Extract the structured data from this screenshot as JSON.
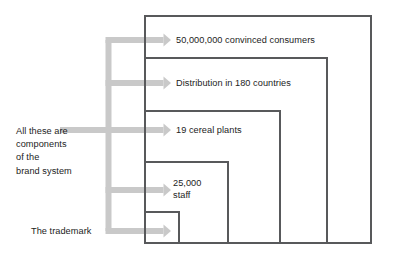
{
  "diagram": {
    "type": "nested-boxes-with-callouts",
    "colors": {
      "box_stroke": "#58595b",
      "arrow_fill": "#c9c9c9",
      "text": "#1c1c1c",
      "background": "#ffffff"
    },
    "side_label": {
      "name": "brand-system-note",
      "lines": [
        "All these are",
        "components",
        "of the",
        "brand system"
      ]
    },
    "trademark_label": {
      "name": "trademark-callout",
      "text": "The trademark"
    },
    "layers": [
      {
        "id": "consumers",
        "label": "50,000,000 convinced consumers",
        "level": 5,
        "box": {
          "x": 145,
          "y": 16,
          "width": 226,
          "height": 227
        }
      },
      {
        "id": "distribution",
        "label": "Distribution in 180 countries",
        "level": 4,
        "box": {
          "x": 145,
          "y": 58,
          "width": 182,
          "height": 185
        }
      },
      {
        "id": "plants",
        "label": "19 cereal plants",
        "level": 3,
        "box": {
          "x": 145,
          "y": 111,
          "width": 135,
          "height": 132
        }
      },
      {
        "id": "staff",
        "label": "25,000 staff",
        "label_lines": [
          "25,000",
          "staff"
        ],
        "level": 2,
        "box": {
          "x": 145,
          "y": 162,
          "width": 83,
          "height": 81
        }
      },
      {
        "id": "trademark",
        "label": "The trademark",
        "level": 1,
        "box": {
          "x": 145,
          "y": 212,
          "width": 34,
          "height": 31
        }
      }
    ],
    "arrows": [
      {
        "id": "arrow-consumers",
        "target": "consumers",
        "tip_x": 171,
        "y": 40
      },
      {
        "id": "arrow-distribution",
        "target": "distribution",
        "tip_x": 171,
        "y": 83
      },
      {
        "id": "arrow-plants",
        "target": "plants",
        "tip_x": 171,
        "y": 130
      },
      {
        "id": "arrow-staff",
        "target": "staff",
        "tip_x": 171,
        "y": 190
      },
      {
        "id": "arrow-trademark",
        "target": "trademark",
        "tip_x": 171,
        "y": 231
      }
    ],
    "bus": {
      "x": 108.5,
      "top_y": 40,
      "bottom_y": 231,
      "thickness": 6
    }
  }
}
